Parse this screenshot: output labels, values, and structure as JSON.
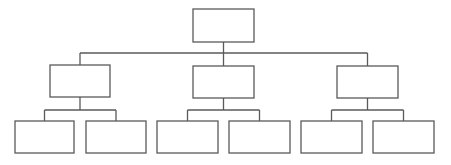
{
  "diagram": {
    "type": "org-chart",
    "line_color": "#5a5a5a",
    "box_fill": "#ffffff",
    "stroke_width": 1.3,
    "nodes": [
      {
        "id": "root",
        "label": "",
        "x": 193,
        "y": 9,
        "w": 61,
        "h": 33
      },
      {
        "id": "mid-left",
        "label": "",
        "x": 50,
        "y": 65,
        "w": 60,
        "h": 32
      },
      {
        "id": "mid-center",
        "label": "",
        "x": 193,
        "y": 66,
        "w": 61,
        "h": 32
      },
      {
        "id": "mid-right",
        "label": "",
        "x": 337,
        "y": 66,
        "w": 61,
        "h": 32
      },
      {
        "id": "leaf-1",
        "label": "",
        "x": 15,
        "y": 121,
        "w": 59,
        "h": 32
      },
      {
        "id": "leaf-2",
        "label": "",
        "x": 86,
        "y": 121,
        "w": 60,
        "h": 32
      },
      {
        "id": "leaf-3",
        "label": "",
        "x": 157,
        "y": 121,
        "w": 61,
        "h": 32
      },
      {
        "id": "leaf-4",
        "label": "",
        "x": 229,
        "y": 121,
        "w": 61,
        "h": 32
      },
      {
        "id": "leaf-5",
        "label": "",
        "x": 301,
        "y": 121,
        "w": 61,
        "h": 32
      },
      {
        "id": "leaf-6",
        "label": "",
        "x": 373,
        "y": 121,
        "w": 61,
        "h": 32
      }
    ],
    "edges": [
      {
        "from": "root",
        "to": [
          "mid-left",
          "mid-center",
          "mid-right"
        ],
        "bus_y": 53
      },
      {
        "from": "mid-left",
        "to": [
          "leaf-1",
          "leaf-2"
        ],
        "bus_y": 110
      },
      {
        "from": "mid-center",
        "to": [
          "leaf-3",
          "leaf-4"
        ],
        "bus_y": 110
      },
      {
        "from": "mid-right",
        "to": [
          "leaf-5",
          "leaf-6"
        ],
        "bus_y": 110
      }
    ]
  }
}
